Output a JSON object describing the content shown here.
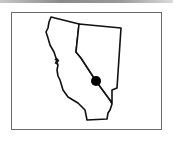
{
  "map": {
    "description": "Outline map of California and Nevada with a location marker",
    "regions": [
      {
        "name": "California"
      },
      {
        "name": "Nevada"
      }
    ],
    "marker": {
      "label": "Location marker",
      "color": "#000000"
    },
    "colors": {
      "outline": "#111111",
      "frame": "#6a6a6a",
      "background": "#ffffff"
    }
  }
}
